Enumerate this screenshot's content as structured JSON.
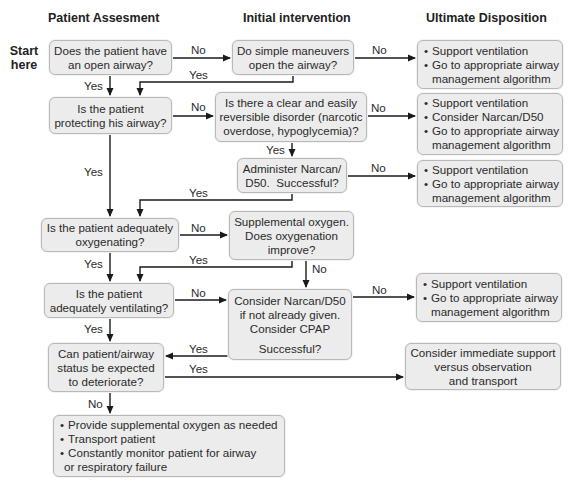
{
  "headers": {
    "col1": "Patient Assesment",
    "col2": "Initial intervention",
    "col3": "Ultimate Disposition"
  },
  "start_label": [
    "Start",
    "here"
  ],
  "assessment": {
    "open_airway": [
      "Does the patient have",
      "an open airway?"
    ],
    "protecting_airway": [
      "Is the patient",
      "protecting his airway?"
    ],
    "oxygenating": [
      "Is the patient adequately",
      "oxygenating?"
    ],
    "ventilating": [
      "Is the patient",
      "adequately ventilating?"
    ],
    "deteriorate": [
      "Can patient/airway",
      "status be expected",
      "to deteriorate?"
    ]
  },
  "intervention": {
    "simple_maneuvers": [
      "Do simple maneuvers",
      "open the airway?"
    ],
    "reversible_disorder": [
      "Is there a clear and easily",
      "reversible disorder (narcotic",
      "overdose, hypoglycemia)?"
    ],
    "administer_narcan": [
      "Administer Narcan/",
      "D50.  Successful?"
    ],
    "supplemental_oxygen": [
      "Supplemental oxygen.",
      "Does oxygenation",
      "improve?"
    ],
    "consider_narcan_cpap": [
      "Consider Narcan/D50",
      "if not already given.",
      "Consider CPAP",
      "Successful?"
    ]
  },
  "disposition": {
    "d1": {
      "bullets": [
        "Support ventilation",
        "Go to appropriate airway"
      ],
      "continuation": "management algorithm"
    },
    "d2": {
      "bullets": [
        "Support ventilation",
        "Consider Narcan/D50",
        "Go to appropriate airway"
      ],
      "continuation": "management algorithm"
    },
    "d3": {
      "bullets": [
        "Support ventilation",
        "Go to appropriate airway"
      ],
      "continuation": "management algorithm"
    },
    "d4": {
      "bullets": [
        "Support ventilation",
        "Go to appropriate airway"
      ],
      "continuation": "management algorithm"
    },
    "observe": [
      "Consider immediate support",
      "versus observation",
      "and transport"
    ]
  },
  "final": {
    "bullets": [
      "Provide supplemental oxygen as needed",
      "Transport patient",
      "Constantly monitor patient for airway"
    ],
    "continuation": "or respiratory failure"
  },
  "edge_labels": {
    "yes": "Yes",
    "no": "No"
  },
  "colors": {
    "box_fill": "#ececec",
    "box_border": "#b8b8b8",
    "line": "#1a1a1a",
    "text": "#2a2a2a"
  }
}
